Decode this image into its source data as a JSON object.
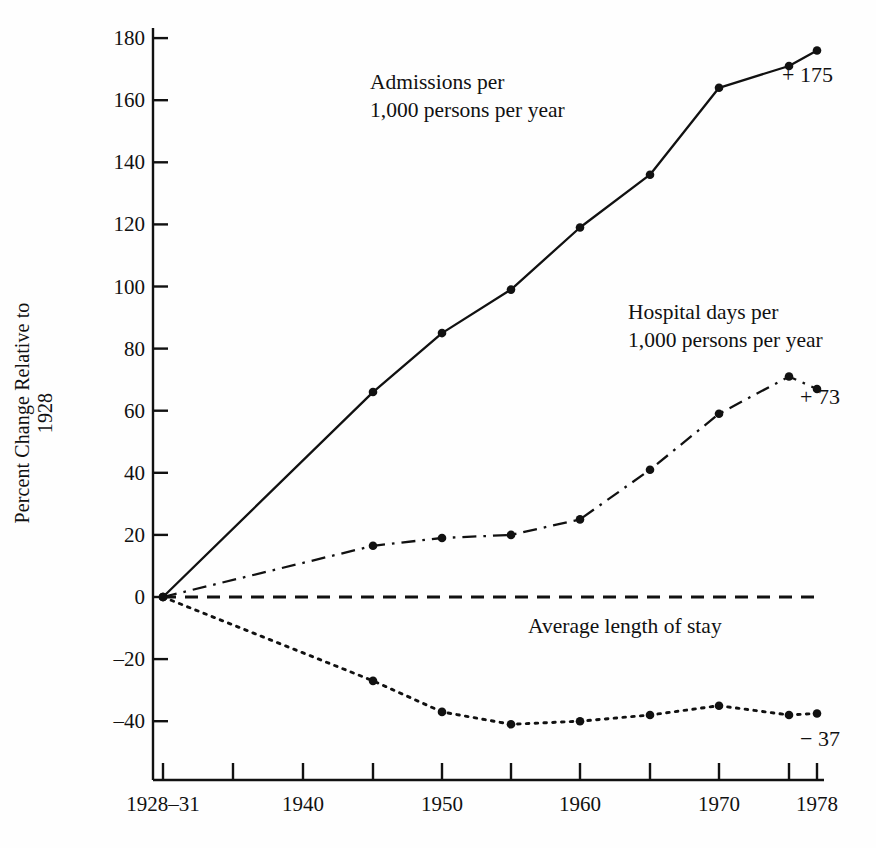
{
  "chart_data": {
    "type": "line",
    "title": "",
    "xlabel": "",
    "ylabel": "Percent Change Relative to 1928",
    "ylim": [
      -50,
      185
    ],
    "yticks": [
      180,
      160,
      140,
      120,
      100,
      80,
      60,
      40,
      20,
      0,
      -20,
      -40
    ],
    "ytick_labels": [
      "180",
      "160",
      "140",
      "120",
      "100",
      "80",
      "60",
      "40",
      "20",
      "0",
      "–20",
      "–40"
    ],
    "x": [
      1929.5,
      1935,
      1940,
      1945,
      1950,
      1955,
      1960,
      1965,
      1970,
      1975,
      1978
    ],
    "xticks": [
      1929.5,
      1935,
      1940,
      1945,
      1950,
      1955,
      1960,
      1965,
      1970,
      1975,
      1978
    ],
    "xtick_labels": [
      "1928–31",
      "",
      "1940",
      "",
      "1950",
      "",
      "1960",
      "",
      "1970",
      "",
      "1978"
    ],
    "grid": false,
    "legend": "inline-annotations",
    "series": [
      {
        "name": "Admissions per 1,000 persons per year",
        "style": "solid",
        "marker": "filled-circle",
        "x": [
          1929.5,
          1945,
          1950,
          1955,
          1960,
          1965,
          1970,
          1975,
          1978
        ],
        "values": [
          0,
          66,
          85,
          99,
          119,
          136,
          164,
          171,
          176
        ],
        "end_label": "+ 175"
      },
      {
        "name": "Hospital days per 1,000 persons per year",
        "style": "dash-dot",
        "marker": "filled-circle",
        "x": [
          1929.5,
          1945,
          1950,
          1955,
          1960,
          1965,
          1970,
          1975,
          1978
        ],
        "values": [
          0,
          16.5,
          19,
          20,
          25,
          41,
          59,
          71,
          67
        ],
        "end_label": "+ 73"
      },
      {
        "name": "Average length of stay",
        "style": "dotted",
        "marker": "filled-circle",
        "x": [
          1929.5,
          1945,
          1950,
          1955,
          1960,
          1965,
          1970,
          1975,
          1978
        ],
        "values": [
          0,
          -27,
          -37,
          -41,
          -40,
          -38,
          -35,
          -38,
          -37.5
        ],
        "end_label": "− 37"
      },
      {
        "name": "Zero reference line",
        "style": "dashed",
        "marker": "none",
        "x": [
          1929.5,
          1978
        ],
        "values": [
          0,
          0
        ],
        "end_label": ""
      }
    ],
    "annotations": [
      {
        "name": "admissions-label",
        "line1": "Admissions per",
        "line2": "1,000 persons per year",
        "x": 370,
        "y": 68
      },
      {
        "name": "hospital-days-label",
        "line1": "Hospital days per",
        "line2": "1,000 persons per year",
        "x": 628,
        "y": 298
      },
      {
        "name": "length-of-stay-label",
        "line1": "Average length of stay",
        "line2": "",
        "x": 528,
        "y": 612
      }
    ],
    "end_labels": [
      {
        "name": "admissions-end-label",
        "text": "+ 175",
        "x": 782,
        "y": 62
      },
      {
        "name": "hospital-days-end-label",
        "text": "+ 73",
        "x": 800,
        "y": 384
      },
      {
        "name": "length-of-stay-end-label",
        "text": "− 37",
        "x": 800,
        "y": 726
      }
    ]
  }
}
